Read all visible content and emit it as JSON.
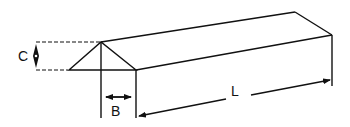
{
  "diagram": {
    "type": "triangular prism dimension drawing",
    "labels": {
      "height": "C",
      "half_width": "B",
      "length": "L"
    },
    "colors": {
      "stroke": "#111111",
      "background": "#ffffff"
    }
  }
}
